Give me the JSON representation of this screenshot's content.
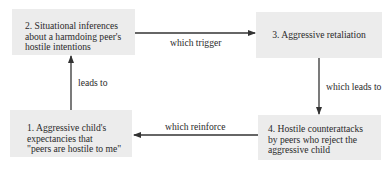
{
  "diagram": {
    "type": "cycle-flowchart",
    "box_color": "#ececec",
    "line_color": "#333333",
    "nodes": [
      {
        "id": "1",
        "lines": [
          "1. Aggressive child's",
          "expectancies that",
          "\"peers are hostile to me\""
        ]
      },
      {
        "id": "2",
        "lines": [
          "2. Situational inferences",
          "about a harmdoing peer's",
          "hostile intentions"
        ]
      },
      {
        "id": "3",
        "lines": [
          "3. Aggressive retaliation"
        ]
      },
      {
        "id": "4",
        "lines": [
          "4. Hostile counterattacks",
          "by peers who reject the",
          "aggressive child"
        ]
      }
    ],
    "edges": [
      {
        "from": "1",
        "to": "2",
        "label": "leads to"
      },
      {
        "from": "2",
        "to": "3",
        "label": "which trigger"
      },
      {
        "from": "3",
        "to": "4",
        "label": "which leads to"
      },
      {
        "from": "4",
        "to": "1",
        "label": "which reinforce"
      }
    ]
  }
}
